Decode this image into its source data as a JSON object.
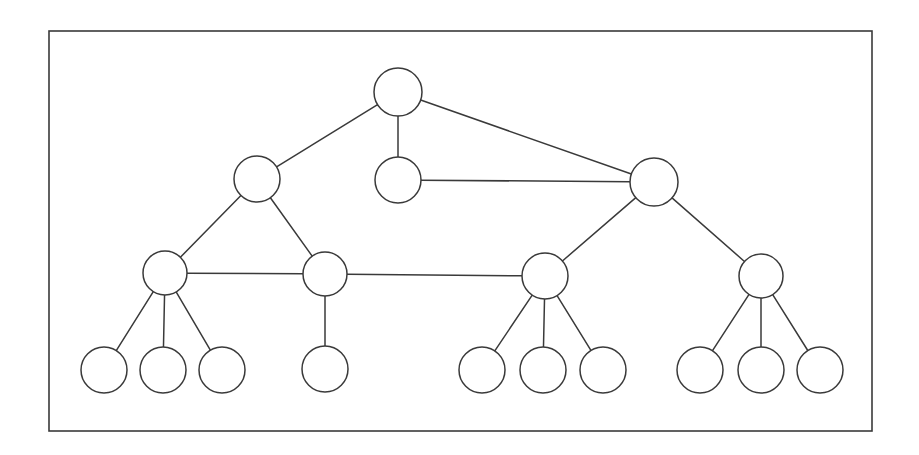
{
  "page": {
    "width": 919,
    "height": 455,
    "background_color": "#ffffff",
    "stroke_color": "#3a3a3a",
    "node_fill_color": "#ffffff"
  },
  "frame": {
    "name": "diagram-border",
    "x": 49,
    "y": 31,
    "width": 823,
    "height": 400,
    "stroke_color": "#3a3a3a",
    "stroke_width": 1.6,
    "fill": "none"
  },
  "chart_data": {
    "type": "diagram",
    "subtype": "node-link-graph",
    "xlabel": "",
    "ylabel": "",
    "grid": false,
    "legend": "none",
    "node_count": 18,
    "edge_count": 20,
    "levels": 4,
    "nodes": [
      {
        "id": "n0",
        "label": "",
        "level": 0,
        "cx": 398,
        "cy": 92,
        "r": 24
      },
      {
        "id": "n1",
        "label": "",
        "level": 1,
        "cx": 257,
        "cy": 179,
        "r": 23
      },
      {
        "id": "n2",
        "label": "",
        "level": 1,
        "cx": 398,
        "cy": 180,
        "r": 23
      },
      {
        "id": "n3",
        "label": "",
        "level": 1,
        "cx": 654,
        "cy": 182,
        "r": 24
      },
      {
        "id": "n4",
        "label": "",
        "level": 2,
        "cx": 165,
        "cy": 273,
        "r": 22
      },
      {
        "id": "n5",
        "label": "",
        "level": 2,
        "cx": 325,
        "cy": 274,
        "r": 22
      },
      {
        "id": "n6",
        "label": "",
        "level": 2,
        "cx": 545,
        "cy": 276,
        "r": 23
      },
      {
        "id": "n7",
        "label": "",
        "level": 2,
        "cx": 761,
        "cy": 276,
        "r": 22
      },
      {
        "id": "n8",
        "label": "",
        "level": 3,
        "cx": 104,
        "cy": 370,
        "r": 23
      },
      {
        "id": "n9",
        "label": "",
        "level": 3,
        "cx": 163,
        "cy": 370,
        "r": 23
      },
      {
        "id": "n10",
        "label": "",
        "level": 3,
        "cx": 222,
        "cy": 370,
        "r": 23
      },
      {
        "id": "n11",
        "label": "",
        "level": 3,
        "cx": 325,
        "cy": 369,
        "r": 23
      },
      {
        "id": "n12",
        "label": "",
        "level": 3,
        "cx": 482,
        "cy": 370,
        "r": 23
      },
      {
        "id": "n13",
        "label": "",
        "level": 3,
        "cx": 543,
        "cy": 370,
        "r": 23
      },
      {
        "id": "n14",
        "label": "",
        "level": 3,
        "cx": 603,
        "cy": 370,
        "r": 23
      },
      {
        "id": "n15",
        "label": "",
        "level": 3,
        "cx": 700,
        "cy": 370,
        "r": 23
      },
      {
        "id": "n16",
        "label": "",
        "level": 3,
        "cx": 761,
        "cy": 370,
        "r": 23
      },
      {
        "id": "n17",
        "label": "",
        "level": 3,
        "cx": 820,
        "cy": 370,
        "r": 23
      }
    ],
    "edges": [
      {
        "source": "n0",
        "target": "n1"
      },
      {
        "source": "n0",
        "target": "n2"
      },
      {
        "source": "n0",
        "target": "n3"
      },
      {
        "source": "n2",
        "target": "n3"
      },
      {
        "source": "n1",
        "target": "n4"
      },
      {
        "source": "n1",
        "target": "n5"
      },
      {
        "source": "n4",
        "target": "n5"
      },
      {
        "source": "n5",
        "target": "n6"
      },
      {
        "source": "n3",
        "target": "n6"
      },
      {
        "source": "n3",
        "target": "n7"
      },
      {
        "source": "n4",
        "target": "n8"
      },
      {
        "source": "n4",
        "target": "n9"
      },
      {
        "source": "n4",
        "target": "n10"
      },
      {
        "source": "n5",
        "target": "n11"
      },
      {
        "source": "n6",
        "target": "n12"
      },
      {
        "source": "n6",
        "target": "n13"
      },
      {
        "source": "n6",
        "target": "n14"
      },
      {
        "source": "n7",
        "target": "n15"
      },
      {
        "source": "n7",
        "target": "n16"
      },
      {
        "source": "n7",
        "target": "n17"
      }
    ]
  }
}
